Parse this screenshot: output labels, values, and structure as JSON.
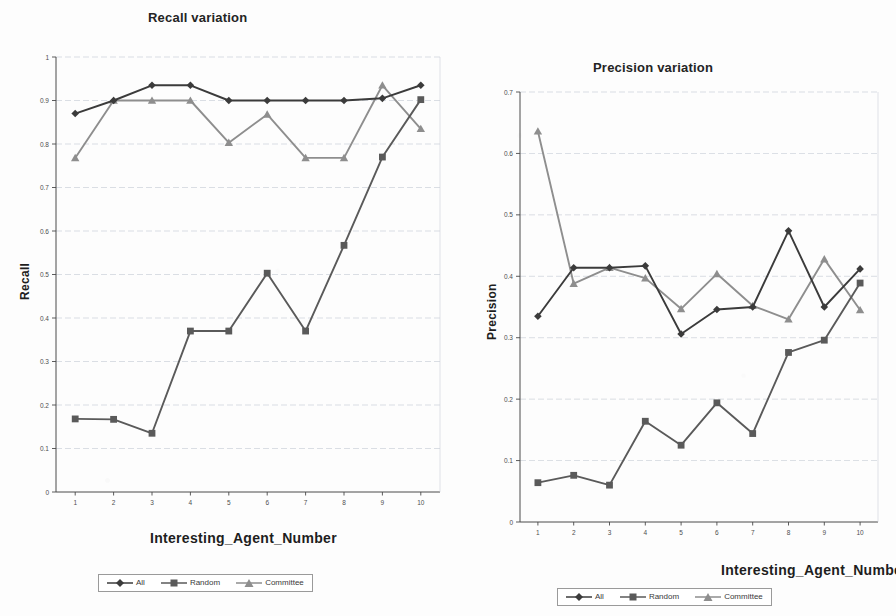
{
  "page": {
    "background": "#fdfdfd",
    "width": 896,
    "height": 616
  },
  "series_style": {
    "all_color": "#3b3b3b",
    "random_color": "#5a5a5a",
    "committee_color": "#8e8e8e"
  },
  "legend": {
    "entries": [
      {
        "label": "All",
        "marker": "diamond-marker",
        "color": "#3b3b3b"
      },
      {
        "label": "Random",
        "marker": "square-marker",
        "color": "#5a5a5a"
      },
      {
        "label": "Committee",
        "marker": "triangle-marker",
        "color": "#8e8e8e"
      }
    ]
  },
  "chart_data": [
    {
      "id": "recall",
      "type": "line",
      "title": "Recall variation",
      "xlabel": "Interesting_Agent_Number",
      "ylabel": "Recall",
      "x": [
        1,
        2,
        3,
        4,
        5,
        6,
        7,
        8,
        9,
        10
      ],
      "xticklabels": [
        "1",
        "2",
        "3",
        "4",
        "5",
        "6",
        "7",
        "8",
        "9",
        "10"
      ],
      "xlim": [
        0.5,
        10.5
      ],
      "ylim": [
        0,
        1
      ],
      "yticks": [
        0,
        0.1,
        0.2,
        0.3,
        0.4,
        0.5,
        0.6,
        0.7,
        0.8,
        0.9,
        1
      ],
      "yticklabels": [
        "0",
        "0.1",
        "0.2",
        "0.3",
        "0.4",
        "0.5",
        "0.6",
        "0.7",
        "0.8",
        "0.9",
        "1"
      ],
      "grid": true,
      "legend_position": "below",
      "series": [
        {
          "name": "All",
          "marker": "diamond",
          "color": "#3b3b3b",
          "values": [
            0.87,
            0.9,
            0.935,
            0.935,
            0.9,
            0.9,
            0.9,
            0.9,
            0.905,
            0.935
          ]
        },
        {
          "name": "Random",
          "marker": "square",
          "color": "#5a5a5a",
          "values": [
            0.168,
            0.167,
            0.135,
            0.37,
            0.37,
            0.503,
            0.37,
            0.567,
            0.77,
            0.902
          ]
        },
        {
          "name": "Committee",
          "marker": "triangle",
          "color": "#8e8e8e",
          "values": [
            0.768,
            0.9,
            0.9,
            0.9,
            0.803,
            0.868,
            0.768,
            0.768,
            0.935,
            0.835
          ]
        }
      ]
    },
    {
      "id": "precision",
      "type": "line",
      "title": "Precision variation",
      "xlabel": "Interesting_Agent_Number",
      "ylabel": "Precision",
      "x": [
        1,
        2,
        3,
        4,
        5,
        6,
        7,
        8,
        9,
        10
      ],
      "xticklabels": [
        "1",
        "2",
        "3",
        "4",
        "5",
        "6",
        "7",
        "8",
        "9",
        "10"
      ],
      "xlim": [
        0.5,
        10.5
      ],
      "ylim": [
        0,
        0.7
      ],
      "yticks": [
        0,
        0.1,
        0.2,
        0.3,
        0.4,
        0.5,
        0.6,
        0.7
      ],
      "yticklabels": [
        "0",
        "0.1",
        "0.2",
        "0.3",
        "0.4",
        "0.5",
        "0.6",
        "0.7"
      ],
      "grid": true,
      "legend_position": "below",
      "series": [
        {
          "name": "All",
          "marker": "diamond",
          "color": "#3b3b3b",
          "values": [
            0.335,
            0.414,
            0.414,
            0.417,
            0.306,
            0.346,
            0.35,
            0.474,
            0.35,
            0.412
          ]
        },
        {
          "name": "Random",
          "marker": "square",
          "color": "#5a5a5a",
          "values": [
            0.064,
            0.076,
            0.06,
            0.164,
            0.125,
            0.194,
            0.144,
            0.276,
            0.296,
            0.389
          ]
        },
        {
          "name": "Committee",
          "marker": "triangle",
          "color": "#8e8e8e",
          "values": [
            0.636,
            0.388,
            0.414,
            0.397,
            0.347,
            0.404,
            0.352,
            0.33,
            0.428,
            0.345
          ]
        }
      ]
    }
  ]
}
